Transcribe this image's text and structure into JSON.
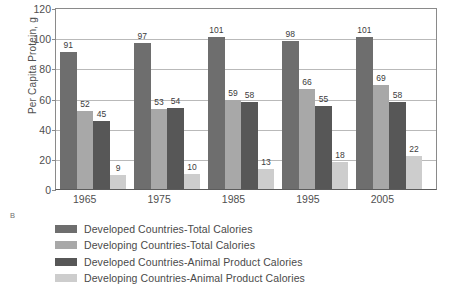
{
  "chart_data": {
    "type": "bar",
    "title": "",
    "panel_letter": "B",
    "xlabel": "",
    "ylabel": "Per Capita Protein, g",
    "ylim": [
      0,
      120
    ],
    "yticks": [
      0,
      20,
      40,
      60,
      80,
      100,
      120
    ],
    "grid": true,
    "legend_position": "below",
    "categories": [
      "1965",
      "1975",
      "1985",
      "1995",
      "2005"
    ],
    "series": [
      {
        "name": "Developed Countries-Total Calories",
        "color": "#6e6e6e",
        "values": [
          91,
          97,
          101,
          98,
          101
        ]
      },
      {
        "name": "Developing Countries-Total Calories",
        "color": "#a8a8a8",
        "values": [
          52,
          53,
          59,
          66,
          69
        ]
      },
      {
        "name": "Developed Countries-Animal Product Calories",
        "color": "#575757",
        "values": [
          45,
          54,
          58,
          55,
          58
        ]
      },
      {
        "name": "Developing Countries-Animal Product Calories",
        "color": "#cdcdcd",
        "values": [
          9,
          10,
          13,
          18,
          22
        ]
      }
    ]
  }
}
